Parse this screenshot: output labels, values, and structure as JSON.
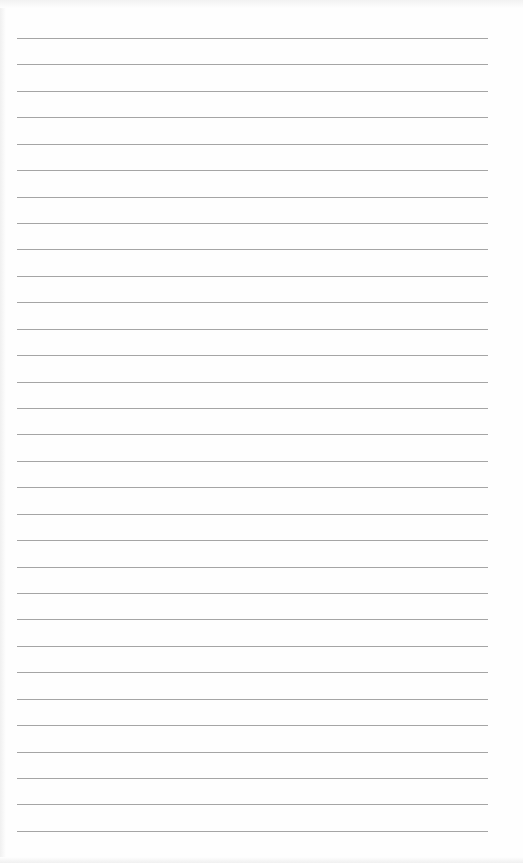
{
  "page": {
    "type": "lined-paper",
    "line_count": 31,
    "first_line_y": 38,
    "line_spacing": 26.43,
    "line_left": 17,
    "line_width": 471,
    "line_color": "#8e8e8e",
    "paper_color": "#fefefe"
  }
}
